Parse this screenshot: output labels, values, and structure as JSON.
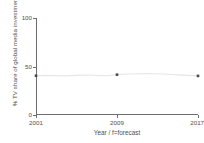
{
  "chart_data": {
    "type": "line",
    "title": "",
    "xlabel": "Year / f=forecast",
    "ylabel": "% TV share of global media investment",
    "ylim": [
      0,
      100
    ],
    "yticks": [
      0,
      50,
      100
    ],
    "ytick_labels": [
      "0",
      "50",
      "100"
    ],
    "xlim": [
      2001,
      2017
    ],
    "xticks": [
      2001,
      2009,
      2017
    ],
    "xtick_labels": [
      "2001",
      "2009",
      "2017f"
    ],
    "grid": false,
    "legend": false,
    "line_color": "#e6e6e6",
    "marker_color": "#4a4a4a",
    "axis_color": "#6e6e6e",
    "background_color": "#ffffff",
    "x": [
      2001,
      2002,
      2003,
      2004,
      2005,
      2006,
      2007,
      2008,
      2009,
      2010,
      2011,
      2012,
      2013,
      2014,
      2015,
      2016,
      2017
    ],
    "values": [
      40.5,
      40.8,
      40.6,
      40.3,
      40.9,
      41.2,
      40.7,
      40.4,
      41.6,
      42.2,
      42.6,
      42.8,
      42.5,
      42.0,
      41.4,
      40.8,
      40.3
    ],
    "series": [
      {
        "name": "TV share of global media investment",
        "values": [
          40.5,
          40.8,
          40.6,
          40.3,
          40.9,
          41.2,
          40.7,
          40.4,
          41.6,
          42.2,
          42.6,
          42.8,
          42.5,
          42.0,
          41.4,
          40.8,
          40.3
        ]
      }
    ],
    "marker_points": [
      {
        "x": 2001,
        "y": 40.5
      },
      {
        "x": 2009,
        "y": 41.6
      },
      {
        "x": 2017,
        "y": 40.3
      }
    ]
  }
}
